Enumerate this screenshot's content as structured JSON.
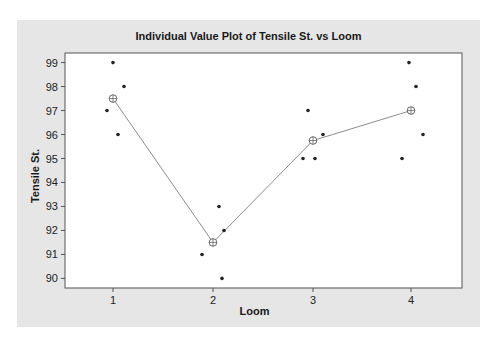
{
  "chart_data": {
    "type": "scatter",
    "title": "Individual Value Plot of Tensile St. vs Loom",
    "xlabel": "Loom",
    "ylabel": "Tensile St.",
    "categories": [
      "1",
      "2",
      "3",
      "4"
    ],
    "ylim": [
      89.6,
      99.4
    ],
    "yticks": [
      90,
      91,
      92,
      93,
      94,
      95,
      96,
      97,
      98,
      99
    ],
    "grid": false,
    "legend": null,
    "points": [
      {
        "loom": "1",
        "values": [
          99,
          98,
          97,
          96
        ]
      },
      {
        "loom": "2",
        "values": [
          93,
          92,
          91,
          90
        ]
      },
      {
        "loom": "3",
        "values": [
          97,
          96,
          95,
          95
        ]
      },
      {
        "loom": "4",
        "values": [
          99,
          98,
          96,
          95
        ]
      }
    ],
    "mean_line": {
      "name": "Mean",
      "values": [
        97.5,
        91.5,
        95.75,
        97.0
      ],
      "marker": "circle-plus"
    }
  },
  "colors": {
    "frame_bg": "#e6e6e6",
    "plot_bg": "#ffffff",
    "point": "#222222",
    "mean_line": "#8c8c8c"
  }
}
